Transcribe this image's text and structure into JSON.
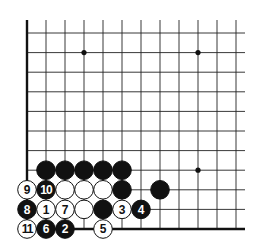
{
  "diagram": {
    "type": "go-board-corner",
    "grid": {
      "origin_x": 27,
      "origin_y": 33,
      "col_spacing": 19,
      "row_spacing": 19.6,
      "cols": 12,
      "rows": 11,
      "right_extent": 245,
      "top_extent": 20,
      "line_color": "#222222",
      "edge_color": "#111111"
    },
    "edges": [
      "left",
      "bottom"
    ],
    "star_points": [
      {
        "col": 3,
        "row": 1
      },
      {
        "col": 9,
        "row": 1
      },
      {
        "col": 9,
        "row": 7
      }
    ],
    "stones": [
      {
        "col": 1,
        "row": 7,
        "color": "black",
        "label": ""
      },
      {
        "col": 2,
        "row": 7,
        "color": "black",
        "label": ""
      },
      {
        "col": 3,
        "row": 7,
        "color": "black",
        "label": ""
      },
      {
        "col": 4,
        "row": 7,
        "color": "black",
        "label": ""
      },
      {
        "col": 5,
        "row": 7,
        "color": "black",
        "label": ""
      },
      {
        "col": 0,
        "row": 8,
        "color": "white",
        "label": "9"
      },
      {
        "col": 1,
        "row": 8,
        "color": "black",
        "label": "10"
      },
      {
        "col": 2,
        "row": 8,
        "color": "white",
        "label": ""
      },
      {
        "col": 3,
        "row": 8,
        "color": "white",
        "label": ""
      },
      {
        "col": 4,
        "row": 8,
        "color": "white",
        "label": ""
      },
      {
        "col": 5,
        "row": 8,
        "color": "black",
        "label": ""
      },
      {
        "col": 7,
        "row": 8,
        "color": "black",
        "label": ""
      },
      {
        "col": 0,
        "row": 9,
        "color": "black",
        "label": "8"
      },
      {
        "col": 1,
        "row": 9,
        "color": "white",
        "label": "1"
      },
      {
        "col": 2,
        "row": 9,
        "color": "white",
        "label": "7"
      },
      {
        "col": 3,
        "row": 9,
        "color": "white",
        "label": ""
      },
      {
        "col": 4,
        "row": 9,
        "color": "black",
        "label": ""
      },
      {
        "col": 5,
        "row": 9,
        "color": "white",
        "label": "3"
      },
      {
        "col": 6,
        "row": 9,
        "color": "black",
        "label": "4"
      },
      {
        "col": 0,
        "row": 10,
        "color": "white",
        "label": "11"
      },
      {
        "col": 1,
        "row": 10,
        "color": "black",
        "label": "6"
      },
      {
        "col": 2,
        "row": 10,
        "color": "black",
        "label": "2"
      },
      {
        "col": 4,
        "row": 10,
        "color": "white",
        "label": "5"
      }
    ],
    "colors": {
      "black_stone": "#111111",
      "white_stone": "#ffffff",
      "stone_outline": "#111111",
      "label_on_black": "#ffffff",
      "label_on_white": "#111111"
    }
  }
}
